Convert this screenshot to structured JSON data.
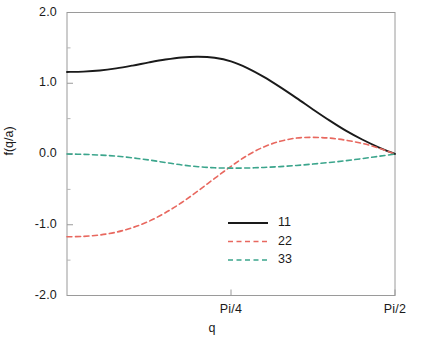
{
  "chart_data": {
    "type": "line",
    "title": "",
    "xlabel": "q",
    "ylabel": "f(q/a)",
    "xlim": [
      0,
      1.5707963
    ],
    "ylim": [
      -2.0,
      2.0
    ],
    "grid": false,
    "legend_position": "bottom-center",
    "x_tick_labels": [
      "Pi/4",
      "Pi/2"
    ],
    "x_tick_values": [
      0.7853982,
      1.5707963
    ],
    "y_tick_labels": [
      "2.0",
      "1.0",
      "0.0",
      "-1.0",
      "-2.0"
    ],
    "y_tick_values": [
      2.0,
      1.0,
      0.0,
      -1.0,
      -2.0
    ],
    "y_minor_tick_values": [
      1.5,
      0.5,
      -0.5,
      -1.5
    ],
    "series": [
      {
        "name": "11",
        "color": "#1a1a1a",
        "style": "solid",
        "x": [
          0.0,
          0.0785,
          0.1571,
          0.2356,
          0.3142,
          0.3927,
          0.4712,
          0.5498,
          0.6283,
          0.7069,
          0.7854,
          0.8639,
          0.9425,
          1.021,
          1.0996,
          1.1781,
          1.2566,
          1.3352,
          1.4137,
          1.4923,
          1.5708
        ],
        "y": [
          1.16,
          1.165,
          1.18,
          1.21,
          1.25,
          1.295,
          1.335,
          1.365,
          1.375,
          1.36,
          1.31,
          1.215,
          1.09,
          0.945,
          0.79,
          0.63,
          0.475,
          0.33,
          0.205,
          0.095,
          0.0
        ]
      },
      {
        "name": "22",
        "color": "#e8685f",
        "style": "dashed",
        "x": [
          0.0,
          0.0785,
          0.1571,
          0.2356,
          0.3142,
          0.3927,
          0.4712,
          0.5498,
          0.6283,
          0.7069,
          0.7854,
          0.8639,
          0.9425,
          1.021,
          1.0996,
          1.1781,
          1.2566,
          1.3352,
          1.4137,
          1.4923,
          1.5708
        ],
        "y": [
          -1.17,
          -1.165,
          -1.145,
          -1.105,
          -1.04,
          -0.95,
          -0.83,
          -0.685,
          -0.52,
          -0.345,
          -0.175,
          -0.02,
          0.1,
          0.18,
          0.225,
          0.235,
          0.225,
          0.195,
          0.15,
          0.085,
          0.0
        ]
      },
      {
        "name": "33",
        "color": "#3ba58c",
        "style": "dashed",
        "x": [
          0.0,
          0.0785,
          0.1571,
          0.2356,
          0.3142,
          0.3927,
          0.4712,
          0.5498,
          0.6283,
          0.7069,
          0.7854,
          0.8639,
          0.9425,
          1.021,
          1.0996,
          1.1781,
          1.2566,
          1.3352,
          1.4137,
          1.4923,
          1.5708
        ],
        "y": [
          0.0,
          -0.005,
          -0.015,
          -0.03,
          -0.055,
          -0.085,
          -0.12,
          -0.155,
          -0.18,
          -0.195,
          -0.2,
          -0.198,
          -0.19,
          -0.178,
          -0.162,
          -0.142,
          -0.12,
          -0.095,
          -0.065,
          -0.033,
          0.0
        ]
      }
    ]
  },
  "axes": {
    "ylabel": "f(q/a)",
    "xlabel": "q",
    "y_ticks": [
      {
        "label": "2.0"
      },
      {
        "label": "1.0"
      },
      {
        "label": "0.0"
      },
      {
        "label": "-1.0"
      },
      {
        "label": "-2.0"
      }
    ],
    "x_ticks": [
      {
        "label": "Pi/4"
      },
      {
        "label": "Pi/2"
      }
    ]
  },
  "legend": {
    "entries": [
      {
        "label": "11"
      },
      {
        "label": "22"
      },
      {
        "label": "33"
      }
    ]
  },
  "colors": {
    "series_11": "#1a1a1a",
    "series_22": "#e8685f",
    "series_33": "#3ba58c",
    "frame": "#9a9a9a",
    "background": "#ffffff"
  }
}
